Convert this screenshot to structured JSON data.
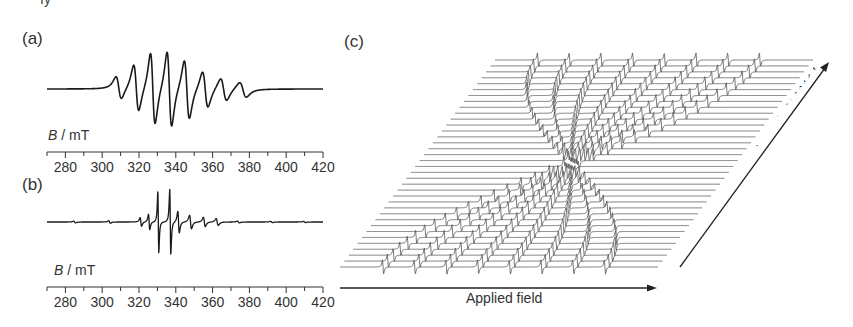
{
  "figure": {
    "top_fragment": "ıy",
    "panels": {
      "a": {
        "label": "(a)",
        "axis_title_var": "B",
        "axis_title_unit": " / mT"
      },
      "b": {
        "label": "(b)",
        "axis_title_var": "B",
        "axis_title_unit": " / mT"
      },
      "c": {
        "label": "(c)",
        "x_arrow_label": "Applied field",
        "y_arrow_label": "Crystal orientation"
      }
    },
    "colors": {
      "trace": "#1a1a1a",
      "axis": "#333333",
      "stack_trace": "#555555"
    }
  },
  "chart_data": [
    {
      "id": "a",
      "type": "line",
      "title": "(a)",
      "xlabel": "B / mT",
      "ylabel": "",
      "xlim": [
        270,
        420
      ],
      "xticks_major": [
        280,
        300,
        320,
        340,
        360,
        380,
        400,
        420
      ],
      "xticks_minor_step": 10,
      "grid": false,
      "description": "Powder EPR derivative spectrum, 8-line hyperfine pattern centered ~336 mT",
      "lines": [
        {
          "center": 309,
          "amp": 0.3,
          "width": 2.6
        },
        {
          "center": 318.5,
          "amp": 0.62,
          "width": 2.4
        },
        {
          "center": 327.5,
          "amp": 0.95,
          "width": 2.2
        },
        {
          "center": 336.5,
          "amp": 1.0,
          "width": 2.2
        },
        {
          "center": 346,
          "amp": 0.78,
          "width": 2.4
        },
        {
          "center": 356,
          "amp": 0.48,
          "width": 2.6
        },
        {
          "center": 366,
          "amp": 0.3,
          "width": 2.9
        },
        {
          "center": 376.5,
          "amp": 0.2,
          "width": 3.2
        }
      ]
    },
    {
      "id": "b",
      "type": "line",
      "title": "(b)",
      "xlabel": "B / mT",
      "ylabel": "",
      "xlim": [
        270,
        420
      ],
      "xticks_major": [
        280,
        300,
        320,
        340,
        360,
        380,
        400,
        420
      ],
      "xticks_minor_step": 10,
      "grid": false,
      "description": "Single-crystal EPR derivative spectrum with sharp lines near 330 and 337 mT",
      "lines": [
        {
          "center": 285,
          "amp": 0.03,
          "width": 0.8
        },
        {
          "center": 304,
          "amp": 0.04,
          "width": 0.8
        },
        {
          "center": 321,
          "amp": 0.14,
          "width": 0.7
        },
        {
          "center": 325.5,
          "amp": 0.25,
          "width": 0.6
        },
        {
          "center": 330.5,
          "amp": 1.0,
          "width": 0.45
        },
        {
          "center": 337,
          "amp": 1.05,
          "width": 0.5
        },
        {
          "center": 341.5,
          "amp": 0.35,
          "width": 0.7
        },
        {
          "center": 348,
          "amp": 0.22,
          "width": 0.9
        },
        {
          "center": 355.5,
          "amp": 0.15,
          "width": 0.9
        },
        {
          "center": 362.5,
          "amp": 0.11,
          "width": 1.0
        },
        {
          "center": 374,
          "amp": 0.03,
          "width": 0.9
        },
        {
          "center": 392,
          "amp": 0.02,
          "width": 0.9
        },
        {
          "center": 410,
          "amp": 0.02,
          "width": 0.9
        }
      ]
    },
    {
      "id": "c",
      "type": "line",
      "title": "(c)",
      "xlabel": "Applied field",
      "ylabel": "Crystal orientation",
      "description": "Stacked (waterfall) single-crystal spectra vs. crystal orientation; 8 hyperfine lines converge at mid-orientation and fan out reversed, forming an X pattern",
      "n_traces": 36,
      "n_lines_per_trace": 8,
      "line_spacing_front_px": 31.7,
      "grid": false
    }
  ]
}
